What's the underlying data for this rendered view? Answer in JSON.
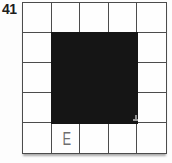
{
  "figure": {
    "number": "41",
    "answer_letter": "E",
    "grid": {
      "rows": 5,
      "cols": 5
    },
    "filled_region": {
      "row_start": 2,
      "col_start": 2,
      "row_span": 3,
      "col_span": 3
    },
    "answer_cell": {
      "row": 5,
      "col": 2
    },
    "colors": {
      "background": "#fdfdfd",
      "cell": "#fefefe",
      "line": "#4c4c4c",
      "fill": "#151515",
      "number": "#1d1d1d",
      "letter": "#6e6e6e"
    }
  }
}
